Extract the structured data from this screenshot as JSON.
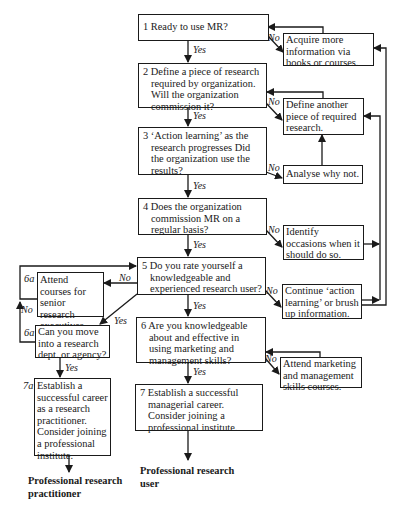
{
  "flowchart": {
    "main_steps": [
      {
        "id": "1",
        "text": "1 Ready to use MR?"
      },
      {
        "id": "2",
        "text": "2 Define a piece of research required by organization. Will the organization commission it?"
      },
      {
        "id": "3",
        "text": "3 ‘Action learning’ as the research progresses Did the organization use the results?"
      },
      {
        "id": "4",
        "text": "4 Does the organization commission MR on a regular basis?"
      },
      {
        "id": "5",
        "text": "5 Do you rate yourself a knowledgeable and experienced research user?"
      },
      {
        "id": "6",
        "text": "6 Are you knowledgeable about and effective in using marketing and management skills?"
      },
      {
        "id": "7",
        "text": "7 Establish a successful managerial career. Consider joining a professional institute."
      }
    ],
    "no_branches": [
      {
        "from": "1",
        "text": "Acquire more information via books or courses."
      },
      {
        "from": "2",
        "text": "Define another piece of required research."
      },
      {
        "from": "3",
        "text": "Analyse why not."
      },
      {
        "from": "4",
        "text": "Identify occasions when it should do so."
      },
      {
        "from": "5",
        "text": "Continue ‘action learning’ or brush up information."
      },
      {
        "from": "6",
        "text": "Attend marketing and management skills courses."
      }
    ],
    "practitioner_path": [
      {
        "id": "6a",
        "label": "6a",
        "text": "Attend courses for senior research executives."
      },
      {
        "id": "6a-q",
        "label": "6a",
        "text": "Can you move into a research dept. or agency?"
      },
      {
        "id": "7a",
        "label": "7a",
        "text": "Establish a successful career as a research practitioner. Consider joining a professional institute."
      }
    ],
    "edge_labels": {
      "yes": "Yes",
      "no": "No"
    },
    "outcomes": {
      "practitioner": "Professional research practitioner",
      "user": "Professional research user"
    }
  }
}
